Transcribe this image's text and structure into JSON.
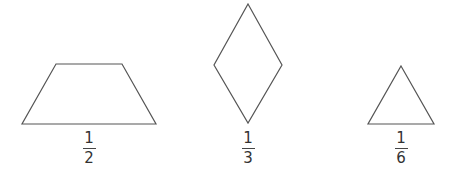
{
  "shapes": [
    {
      "name": "trapezoid",
      "label": {
        "numerator": "1",
        "denominator": "2"
      }
    },
    {
      "name": "rhombus",
      "label": {
        "numerator": "1",
        "denominator": "3"
      }
    },
    {
      "name": "triangle",
      "label": {
        "numerator": "1",
        "denominator": "6"
      }
    }
  ],
  "colors": {
    "stroke": "#555555",
    "background": "#ffffff"
  }
}
